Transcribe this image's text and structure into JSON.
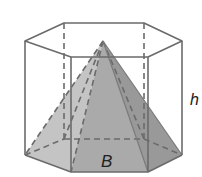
{
  "diagram": {
    "labels": {
      "height": "h",
      "base": "B"
    },
    "colors": {
      "edge": "#6b6b6b",
      "pyramid_light": "#bdbdbd",
      "pyramid_mid": "#a9a9a9",
      "pyramid_dark": "#969696",
      "base_fill": "#b5b5b5",
      "background": "#ffffff"
    }
  }
}
